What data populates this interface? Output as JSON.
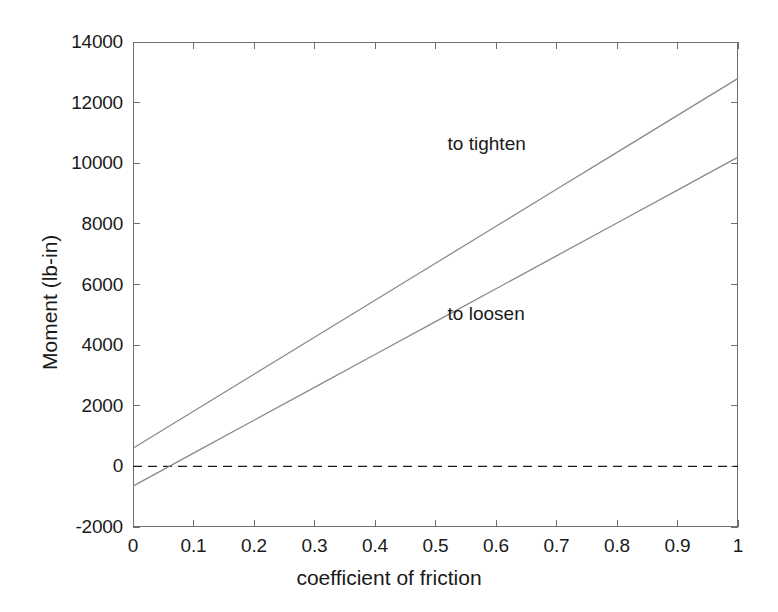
{
  "chart_data": {
    "type": "line",
    "title": "",
    "xlabel": "coefficient of friction",
    "ylabel": "Moment (lb-in)",
    "xlim": [
      0,
      1
    ],
    "ylim": [
      -2000,
      14000
    ],
    "xticks": [
      0,
      0.1,
      0.2,
      0.3,
      0.4,
      0.5,
      0.6,
      0.7,
      0.8,
      0.9,
      1
    ],
    "xticklabels": [
      "0",
      "0.1",
      "0.2",
      "0.3",
      "0.4",
      "0.5",
      "0.6",
      "0.7",
      "0.8",
      "0.9",
      "1"
    ],
    "yticks": [
      -2000,
      0,
      2000,
      4000,
      6000,
      8000,
      10000,
      12000,
      14000
    ],
    "yticklabels": [
      "-2000",
      "0",
      "2000",
      "4000",
      "6000",
      "8000",
      "10000",
      "12000",
      "14000"
    ],
    "grid": false,
    "legend": "none",
    "line_color": "#8a8a8a",
    "axis_color": "#6f6f6f",
    "text_color": "#1a1a1a",
    "series": [
      {
        "name": "to tighten",
        "annotation": "to tighten",
        "annotation_x": 0.52,
        "annotation_y": 10600,
        "x": [
          0,
          0.1,
          0.2,
          0.3,
          0.4,
          0.5,
          0.6,
          0.7,
          0.8,
          0.9,
          1
        ],
        "values": [
          600,
          1820,
          3040,
          4260,
          5480,
          6700,
          7920,
          9140,
          10360,
          11580,
          12800
        ]
      },
      {
        "name": "to loosen",
        "annotation": "to loosen",
        "annotation_x": 0.52,
        "annotation_y": 5000,
        "x": [
          0,
          0.1,
          0.2,
          0.3,
          0.4,
          0.5,
          0.6,
          0.7,
          0.8,
          0.9,
          1
        ],
        "values": [
          -650,
          435,
          1520,
          2605,
          3690,
          4775,
          5860,
          6945,
          8030,
          9115,
          10200
        ]
      }
    ],
    "reference_lines": [
      {
        "name": "zero-line",
        "axis": "y",
        "value": 0,
        "style": "dashed",
        "color": "#1a1a1a"
      }
    ]
  }
}
